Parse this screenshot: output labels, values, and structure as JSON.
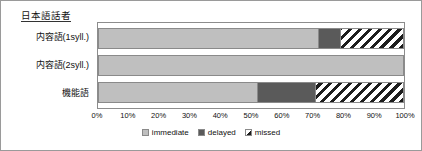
{
  "chart_data": {
    "type": "bar",
    "orientation": "horizontal",
    "stacked": true,
    "normalized": true,
    "title": "日本語話者",
    "xlabel": "",
    "ylabel": "",
    "xlim": [
      0,
      100
    ],
    "grid": false,
    "legend_position": "bottom",
    "categories": [
      "内容語(1syll.)",
      "内容語(2syll.)",
      "機能語"
    ],
    "xticks": [
      "0%",
      "10%",
      "20%",
      "30%",
      "40%",
      "50%",
      "60%",
      "70%",
      "80%",
      "90%",
      "100%"
    ],
    "xtick_values": [
      0,
      10,
      20,
      30,
      40,
      50,
      60,
      70,
      80,
      90,
      100
    ],
    "series": [
      {
        "name": "immediate",
        "values": [
          72,
          100,
          52
        ],
        "color": "#bfbfbf",
        "pattern": "solid"
      },
      {
        "name": "delayed",
        "values": [
          7,
          0,
          19
        ],
        "color": "#5a5a5a",
        "pattern": "solid"
      },
      {
        "name": "missed",
        "values": [
          21,
          0,
          29
        ],
        "color": "#ffffff",
        "pattern": "diagonal-hatch"
      }
    ]
  },
  "legend": {
    "items": [
      {
        "label": "immediate"
      },
      {
        "label": "delayed"
      },
      {
        "label": "missed"
      }
    ]
  },
  "colors": {
    "immediate": "#bfbfbf",
    "delayed": "#5a5a5a",
    "missed_hatch": "#1d1d1d",
    "frame_border": "#8c8c8c",
    "figure_border": "#9a9a9a",
    "text": "#111111"
  }
}
